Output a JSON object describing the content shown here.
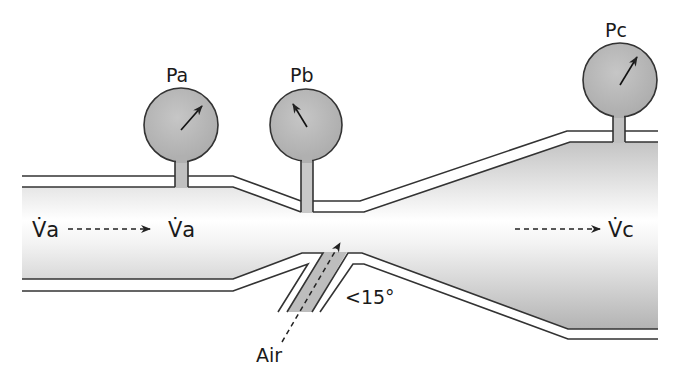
{
  "diagram": {
    "gauges": [
      {
        "id": "pa",
        "label": "Pa",
        "cx": 181,
        "cy": 125,
        "r": 37,
        "needle": [
          181,
          130,
          202,
          106
        ]
      },
      {
        "id": "pb",
        "label": "Pb",
        "cx": 306,
        "cy": 125,
        "r": 36,
        "needle": [
          307,
          127,
          293,
          104
        ]
      },
      {
        "id": "pc",
        "label": "Pc",
        "cx": 620,
        "cy": 80,
        "r": 37,
        "needle": [
          620,
          85,
          637,
          57
        ]
      }
    ],
    "flow_labels": {
      "inlet": "V̇a",
      "inlet_mid": "V̇a",
      "outlet": "V̇c"
    },
    "entrainment_label": "Air",
    "angle_label": "<15°",
    "colors": {
      "gauge_fill": "#b5b5b5",
      "tube_gradient_dark": "#b8b8b8",
      "tube_gradient_light": "#ffffff",
      "stroke": "#333333"
    }
  }
}
